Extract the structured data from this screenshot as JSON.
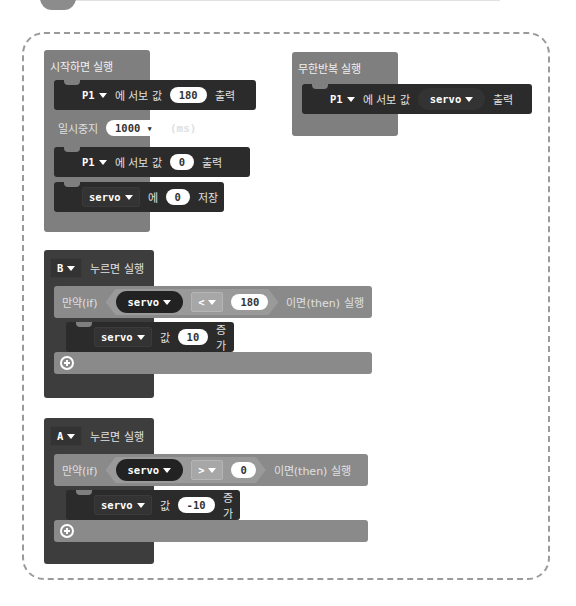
{
  "on_start": {
    "label": "시작하면 실행",
    "blocks": [
      {
        "pin": "P1",
        "text": "에 서보 값",
        "value": "180",
        "suffix": "출력"
      },
      {
        "label": "일시중지",
        "value": "1000",
        "unit": "(ms)"
      },
      {
        "pin": "P1",
        "text": "에 서보 값",
        "value": "0",
        "suffix": "출력"
      },
      {
        "var": "servo",
        "text": "에",
        "value": "0",
        "suffix": "저장"
      }
    ]
  },
  "forever": {
    "label": "무한반복 실행",
    "block": {
      "pin": "P1",
      "text": "에 서보 값",
      "var": "servo",
      "suffix": "출력"
    }
  },
  "button_b": {
    "button": "B",
    "label": "누르면 실행",
    "if_label": "만약(if)",
    "then_label": "이면(then) 실행",
    "cond_var": "servo",
    "operator": "<",
    "cond_value": "180",
    "body": {
      "var": "servo",
      "text": "값",
      "value": "10",
      "suffix": "증가"
    }
  },
  "button_a": {
    "button": "A",
    "label": "누르면 실행",
    "if_label": "만약(if)",
    "then_label": "이면(then) 실행",
    "cond_var": "servo",
    "operator": ">",
    "cond_value": "0",
    "body": {
      "var": "servo",
      "text": "값",
      "value": "-10",
      "suffix": "증가"
    }
  }
}
